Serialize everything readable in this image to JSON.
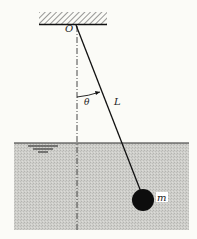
{
  "figure": {
    "type": "pendulum-in-fluid",
    "labels": {
      "pivot": "O",
      "angle": "θ",
      "length": "L",
      "mass": "m"
    },
    "colors": {
      "background": "#fbfbf7",
      "ink": "#1a1a1a",
      "water_fill": "#c9c9c5",
      "water_surface": "#2a2a2a",
      "mass": "#0d0d0d",
      "mass_label_bg": "#ffffff"
    }
  }
}
